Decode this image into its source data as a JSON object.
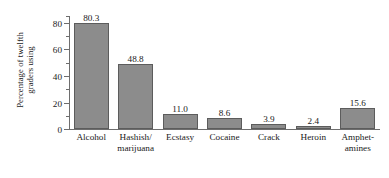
{
  "chart_data": {
    "type": "bar",
    "title": "",
    "xlabel": "",
    "ylabel": "Percentage of twelfth graders using",
    "ylabel_lines": [
      "Percentage of twelfth",
      "graders using"
    ],
    "categories": [
      "Alcohol",
      "Hashish/ marijuana",
      "Ecstasy",
      "Cocaine",
      "Crack",
      "Heroin",
      "Amphet- amines"
    ],
    "category_lines": [
      [
        "Alcohol"
      ],
      [
        "Hashish/",
        "marijuana"
      ],
      [
        "Ecstasy"
      ],
      [
        "Cocaine"
      ],
      [
        "Crack"
      ],
      [
        "Heroin"
      ],
      [
        "Amphet-",
        "amines"
      ]
    ],
    "values": [
      80.3,
      48.8,
      11.0,
      8.6,
      3.9,
      2.4,
      15.6
    ],
    "value_labels": [
      "80.3",
      "48.8",
      "11.0",
      "8.6",
      "3.9",
      "2.4",
      "15.6"
    ],
    "ylim": [
      0,
      86
    ],
    "yticks_major": [
      0,
      20,
      40,
      60,
      80
    ],
    "ytick_labels": [
      "0",
      "20",
      "40",
      "60",
      "80"
    ],
    "yticks_minor": [
      10,
      30,
      50,
      70
    ],
    "grid": false,
    "legend": null,
    "colors": {
      "bar_fill": "#8c8c8c",
      "bar_edge": "#5c5c5c",
      "axis": "#6e6e6e",
      "text": "#1a1a1a",
      "background": "#ffffff"
    }
  }
}
